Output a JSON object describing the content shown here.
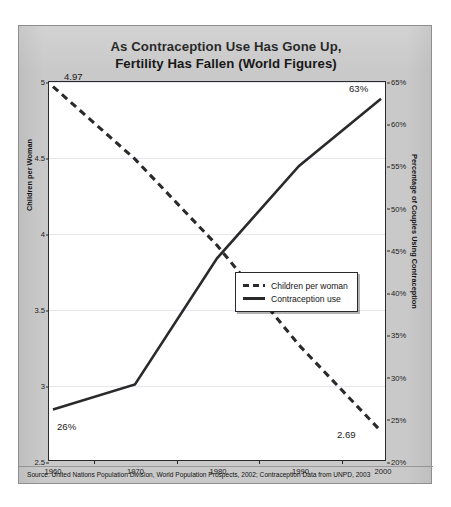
{
  "title": {
    "line1": "As Contraception Use Has Gone Up,",
    "line2": "Fertility Has Fallen (World Figures)"
  },
  "axes": {
    "left_title": "Children per Woman",
    "right_title": "Percentage of Couples Using Contraception",
    "left_ticks": [
      "5",
      "4.5",
      "4",
      "3.5",
      "3",
      "2.5"
    ],
    "right_ticks": [
      "65%",
      "60%",
      "55%",
      "50%",
      "45%",
      "40%",
      "35%",
      "30%",
      "25%",
      "20%"
    ],
    "x_ticks": [
      "1960",
      "1970",
      "1980",
      "1990",
      "2000"
    ]
  },
  "legend": {
    "items": [
      {
        "label": "Children per woman",
        "style": "dashed"
      },
      {
        "label": "Contraception use",
        "style": "solid"
      }
    ]
  },
  "point_labels": {
    "fertility_start": "4.97",
    "fertility_end": "2.69",
    "contraception_start": "26%",
    "contraception_end": "63%"
  },
  "source": "Source: United Nations Population Division, World Population Prospects, 2002; Contraception Data from UNPD, 2003",
  "colors": {
    "card_background": "#c9c9c9",
    "plot_background": "#ffffff",
    "line": "#2a2a2a",
    "gridline": "#e6e6ee",
    "text": "#111111"
  },
  "chart_data": {
    "type": "line",
    "title": "As Contraception Use Has Gone Up, Fertility Has Fallen (World Figures)",
    "xlabel": "",
    "x": [
      1960,
      1970,
      1980,
      1990,
      2000
    ],
    "xtick_labels": [
      "1960",
      "1970",
      "1980",
      "1990",
      "2000"
    ],
    "grid": true,
    "legend_position": "center-right",
    "series": [
      {
        "name": "Children per woman",
        "axis": "left",
        "style": "dashed",
        "values": [
          4.97,
          4.49,
          3.92,
          3.26,
          2.69
        ],
        "ylabel": "Children per Woman",
        "ylim": [
          2.5,
          5.0
        ],
        "ytick_values": [
          2.5,
          3.0,
          3.5,
          4.0,
          4.5,
          5.0
        ],
        "data_labels": {
          "1960": "4.97",
          "2000": "2.69"
        }
      },
      {
        "name": "Contraception use",
        "axis": "right",
        "style": "solid",
        "values": [
          26,
          29,
          44,
          55,
          63
        ],
        "ylabel": "Percentage of Couples Using Contraception",
        "ylim": [
          20,
          65
        ],
        "ytick_values": [
          20,
          25,
          30,
          35,
          40,
          45,
          50,
          55,
          60,
          65
        ],
        "data_labels": {
          "1960": "26%",
          "2000": "63%"
        }
      }
    ],
    "source": "Source: United Nations Population Division, World Population Prospects, 2002; Contraception Data from UNPD, 2003"
  }
}
